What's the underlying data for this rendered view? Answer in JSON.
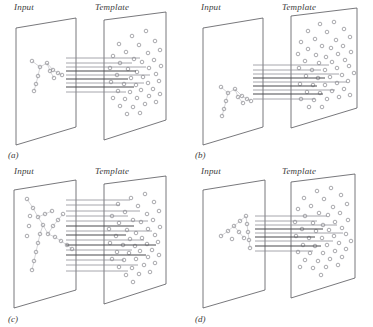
{
  "figure": {
    "type": "diagram",
    "background_color": "#ffffff",
    "plane_stroke_color": "#56565a",
    "point_stroke_color": "#8d8d93",
    "line_color": "#8a8a90",
    "highlight_line_color": "#4a4a4e",
    "constellation_link_color": "#b9b9be"
  },
  "labels": {
    "input": "Input",
    "template": "Template"
  },
  "panels": [
    {
      "id": "a",
      "caption": "(a)",
      "input_points": 11,
      "template_points": 42,
      "match_lines": 9,
      "highlight_lines": 3
    },
    {
      "id": "b",
      "caption": "(b)",
      "input_points": 11,
      "template_points": 48,
      "match_lines": 9,
      "highlight_lines": 3
    },
    {
      "id": "c",
      "caption": "(c)",
      "input_points": 22,
      "template_points": 44,
      "match_lines": 15,
      "highlight_lines": 4
    },
    {
      "id": "d",
      "caption": "(d)",
      "input_points": 12,
      "template_points": 46,
      "match_lines": 9,
      "highlight_lines": 3
    }
  ]
}
